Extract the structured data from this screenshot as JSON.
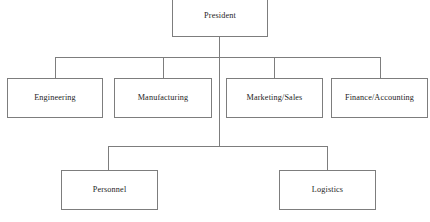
{
  "diagram": {
    "type": "organizational-chart",
    "title": "",
    "background_color": "#ffffff",
    "line_color": "#7d7d7d",
    "box_fill_color": "#ffffff",
    "text_color": "#1d1d1d",
    "levels": [
      {
        "level": 1,
        "nodes": [
          {
            "id": "president",
            "label": "President"
          }
        ]
      },
      {
        "level": 2,
        "nodes": [
          {
            "id": "engineering",
            "label": "Engineering"
          },
          {
            "id": "manufacturing",
            "label": "Manufacturing"
          },
          {
            "id": "marketing-sales",
            "label": "Marketing/Sales"
          },
          {
            "id": "finance-accounting",
            "label": "Finance/Accounting"
          }
        ]
      },
      {
        "level": 3,
        "nodes": [
          {
            "id": "personnel",
            "label": "Personnel"
          },
          {
            "id": "logistics",
            "label": "Logistics"
          }
        ]
      }
    ],
    "edges": [
      {
        "from": "president",
        "to": "engineering"
      },
      {
        "from": "president",
        "to": "manufacturing"
      },
      {
        "from": "president",
        "to": "marketing-sales"
      },
      {
        "from": "president",
        "to": "finance-accounting"
      },
      {
        "from": "president",
        "to": "personnel"
      },
      {
        "from": "president",
        "to": "logistics"
      }
    ]
  }
}
